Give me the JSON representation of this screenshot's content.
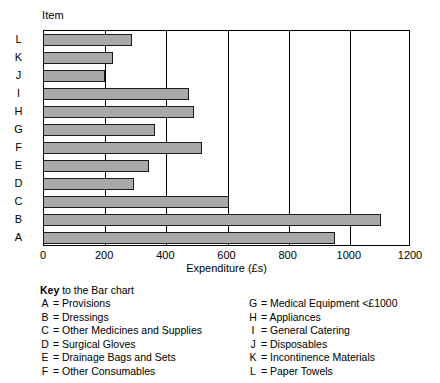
{
  "chart_data": {
    "type": "bar",
    "orientation": "horizontal",
    "title": "",
    "xlabel": "Expenditure (£s)",
    "ylabel": "Item",
    "xlim": [
      0,
      1200
    ],
    "xticks": [
      0,
      200,
      400,
      600,
      800,
      1000,
      1200
    ],
    "grid": true,
    "legend_position": "below",
    "categories": [
      "A",
      "B",
      "C",
      "D",
      "E",
      "F",
      "G",
      "H",
      "I",
      "J",
      "K",
      "L"
    ],
    "values": [
      954,
      1105,
      608,
      297,
      347,
      521,
      367,
      493,
      477,
      203,
      228,
      291
    ],
    "bar_color": "#a9a9a9",
    "bar_border_color": "#1a1a1a"
  },
  "axis": {
    "item_label": "Item",
    "x_title": "Expenditure (£s)",
    "x_ticks": [
      "0",
      "200",
      "400",
      "600",
      "800",
      "1000",
      "1200"
    ],
    "y_categories": [
      "L",
      "K",
      "J",
      "I",
      "H",
      "G",
      "F",
      "E",
      "D",
      "C",
      "B",
      "A"
    ]
  },
  "key": {
    "title_bold": "Key",
    "title_rest": " to the Bar chart",
    "left_column": [
      {
        "letter": "A",
        "eq": "=",
        "label": "Provisions"
      },
      {
        "letter": "B",
        "eq": "=",
        "label": "Dressings"
      },
      {
        "letter": "C",
        "eq": "=",
        "label": "Other Medicines and Supplies"
      },
      {
        "letter": "D",
        "eq": "=",
        "label": "Surgical Gloves"
      },
      {
        "letter": "E",
        "eq": "=",
        "label": "Drainage Bags and Sets"
      },
      {
        "letter": "F",
        "eq": "=",
        "label": "Other Consumables"
      }
    ],
    "right_column": [
      {
        "letter": "G",
        "eq": "=",
        "label": "Medical Equipment <£1000"
      },
      {
        "letter": "H",
        "eq": "=",
        "label": "Appliances"
      },
      {
        "letter": "I",
        "eq": "=",
        "label": "General Catering"
      },
      {
        "letter": "J",
        "eq": "=",
        "label": "Disposables"
      },
      {
        "letter": "K",
        "eq": "=",
        "label": "Incontinence Materials"
      },
      {
        "letter": "L",
        "eq": "=",
        "label": "Paper Towels"
      }
    ]
  }
}
